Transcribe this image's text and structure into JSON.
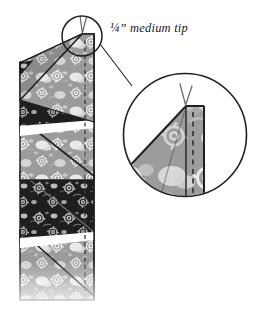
{
  "figure": {
    "annotation": {
      "label": "¼” medium tip",
      "fraction": "¼",
      "unit_mark": "”",
      "text": "medium tip"
    },
    "background_color": "#ffffff",
    "line_color": "#231f20"
  },
  "colors": {
    "light_fabric": "#9b9b9b",
    "light_fabric_shade": "#8a8a8a",
    "light_fabric_motif": "#e8e8e8",
    "light_fabric_motif_soft": "#c9c9c9",
    "dark_fabric": "#231f20",
    "dark_fabric_motif": "#b9b9b9",
    "dark_fabric_motif_soft": "#6e6e6e",
    "white_gap": "#ffffff",
    "outline": "#231f20",
    "seam_dash": "#3a3a3a",
    "thread": "#5a5a5a",
    "circle_stroke": "#231f20",
    "leader_line": "#231f20"
  },
  "strip": {
    "name": "prairie-point-strip",
    "orientation": "vertical",
    "seam_line": {
      "name": "quarter-inch-seam-line",
      "style": "dashed",
      "position": "right-edge"
    },
    "units": [
      {
        "index": 1,
        "fabric": "light",
        "tip": "medium"
      },
      {
        "index": 2,
        "fabric": "dark",
        "tip": "medium"
      },
      {
        "index": 3,
        "fabric": "light",
        "tip": "medium"
      },
      {
        "index": 4,
        "fabric": "dark",
        "tip": "medium"
      },
      {
        "index": 5,
        "fabric": "light",
        "tip": "medium"
      }
    ]
  },
  "detail_circle": {
    "name": "magnified-tip-detail",
    "source_circle": {
      "cx": 82,
      "cy": 36,
      "r": 20
    },
    "magnifier_circle": {
      "cx": 185,
      "cy": 135,
      "r": 62
    },
    "contents": {
      "thread_mark": "v-shaped-thread",
      "seam_line": "dashed",
      "fabric": "light"
    }
  }
}
